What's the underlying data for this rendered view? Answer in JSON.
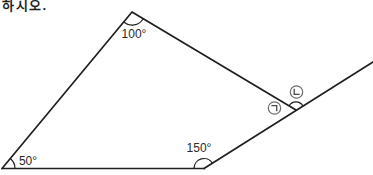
{
  "page": {
    "instruction_text": "하시오.",
    "background_color": "#ffffff",
    "line_color": "#1f1f1f"
  },
  "figure": {
    "type": "geometry-diagram",
    "angle_labels": {
      "top": "100°",
      "bottom_left": "50°",
      "bottom_right": "150°"
    },
    "unknown_angle_marks": [
      {
        "symbol": "㉠",
        "jamo": "giyeok",
        "position": "interior-left-of-right-vertex"
      },
      {
        "symbol": "㉡",
        "jamo": "nieun",
        "position": "above-right-vertex-outside"
      }
    ],
    "vertices": {
      "top": {
        "x": 132,
        "y": 12,
        "angle": "100°"
      },
      "bottom_left": {
        "x": 2,
        "y": 168,
        "angle": "50°"
      },
      "bottom_right": {
        "x": 204,
        "y": 168,
        "angle": "150°"
      },
      "right": {
        "x": 296,
        "y": 110
      }
    },
    "extension_end": {
      "x": 373,
      "y": 62
    }
  }
}
